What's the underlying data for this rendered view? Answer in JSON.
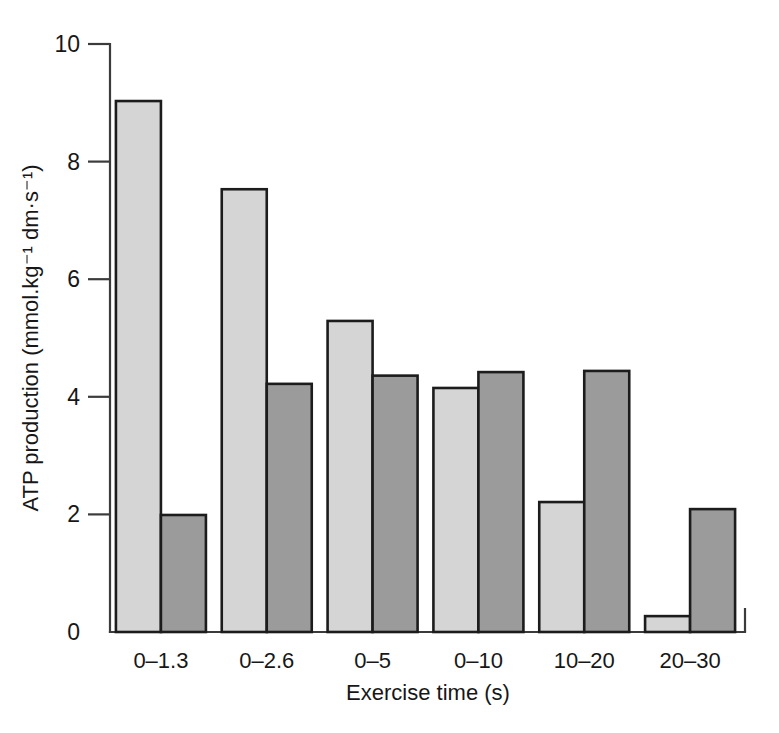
{
  "chart_data": {
    "type": "bar",
    "title": "",
    "subtitle": "",
    "xlabel": "Exercise time (s)",
    "ylabel": "ATP production (mmol.kg⁻¹ dm·s⁻¹)",
    "categories": [
      "0–1.3",
      "0–2.6",
      "0–5",
      "0–10",
      "10–20",
      "20–30"
    ],
    "series": [
      {
        "name": "light-series",
        "color": "#d5d5d5",
        "values": [
          9.03,
          7.53,
          5.29,
          4.15,
          2.21,
          0.27
        ]
      },
      {
        "name": "dark-series",
        "color": "#9b9b9b",
        "values": [
          1.99,
          4.22,
          4.36,
          4.42,
          4.44,
          2.09
        ]
      }
    ],
    "ylim": [
      0,
      10
    ],
    "yticks": [
      0,
      2,
      4,
      6,
      8,
      10
    ],
    "ytick_labels": [
      "0",
      "2",
      "4",
      "6",
      "8",
      "10"
    ],
    "grid": false,
    "legend": "none",
    "bar_outline_color": "#1c1c1c",
    "axis_color": "#3b3b3b",
    "background": "#ffffff"
  }
}
